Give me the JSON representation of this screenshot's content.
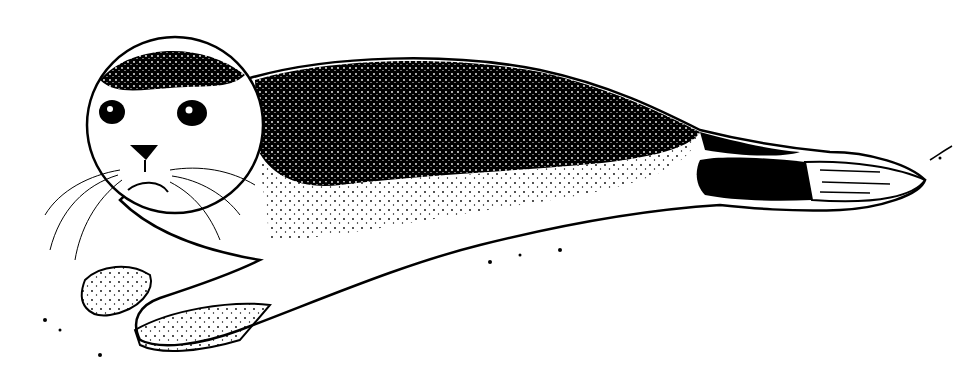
{
  "image": {
    "subject": "Harbor seal lying on its belly, head to the left",
    "style": "black-and-white stipple ink illustration",
    "background_color": "#ffffff",
    "ink_color": "#000000"
  }
}
